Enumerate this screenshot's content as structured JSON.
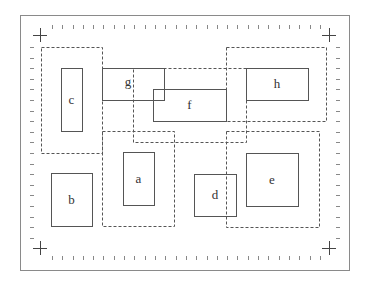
{
  "diagram": {
    "frame": {
      "x": 20,
      "y": 15,
      "w": 329,
      "h": 255,
      "color": "#8a8a8a"
    },
    "ticks": {
      "top_y": 27,
      "bottom_y": 258,
      "left_x": 32,
      "right_x": 338,
      "x_start": 52,
      "x_end": 330,
      "x_step": 10.3,
      "y_start": 47,
      "y_end": 238,
      "y_step": 10.6,
      "color": "#888888"
    },
    "crosses": [
      {
        "name": "top-left",
        "x": 40,
        "y": 35
      },
      {
        "name": "top-right",
        "x": 329,
        "y": 35
      },
      {
        "name": "bottom-left",
        "x": 40,
        "y": 248
      },
      {
        "name": "bottom-right",
        "x": 329,
        "y": 248
      }
    ],
    "dashed_regions": [
      {
        "id": "c",
        "x": 41,
        "y": 47,
        "w": 61,
        "h": 106
      },
      {
        "id": "f",
        "x": 133,
        "y": 68,
        "w": 113,
        "h": 74
      },
      {
        "id": "h",
        "x": 226,
        "y": 47,
        "w": 100,
        "h": 74
      },
      {
        "id": "a",
        "x": 102,
        "y": 131,
        "w": 72,
        "h": 95
      },
      {
        "id": "e",
        "x": 226,
        "y": 131,
        "w": 93,
        "h": 96
      }
    ],
    "boxes": [
      {
        "label": "c",
        "x": 61,
        "y": 68,
        "w": 21,
        "h": 63
      },
      {
        "label": "g",
        "x": 102,
        "y": 68,
        "w": 62,
        "h": 32,
        "label_x": 128,
        "label_y": 86
      },
      {
        "label": "f",
        "x": 153,
        "y": 89,
        "w": 73,
        "h": 32
      },
      {
        "label": "h",
        "x": 246,
        "y": 68,
        "w": 62,
        "h": 32
      },
      {
        "label": "a",
        "x": 123,
        "y": 152,
        "w": 31,
        "h": 53
      },
      {
        "label": "b",
        "x": 51,
        "y": 173,
        "w": 41,
        "h": 53
      },
      {
        "label": "d",
        "x": 194,
        "y": 174,
        "w": 42,
        "h": 42
      },
      {
        "label": "e",
        "x": 246,
        "y": 153,
        "w": 52,
        "h": 53
      }
    ],
    "box_color": "#555555",
    "dash_color": "#555555"
  }
}
